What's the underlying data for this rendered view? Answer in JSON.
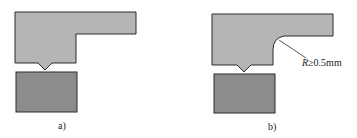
{
  "panels": [
    {
      "id": "a",
      "caption": "a)"
    },
    {
      "id": "b",
      "caption": "b)",
      "annotation": {
        "symbol": "R",
        "text": "≥0.5mm"
      }
    }
  ],
  "colors": {
    "upper_part": "#b5b5b5",
    "lower_part": "#8c8c8c",
    "outline": "#2a2a2a"
  }
}
